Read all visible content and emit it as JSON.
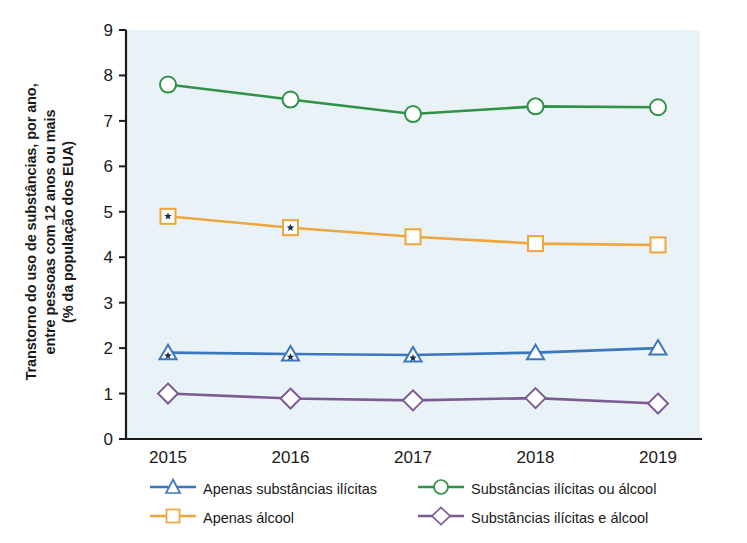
{
  "chart_data": {
    "type": "line",
    "title": "",
    "xlabel": "",
    "ylabel": "Transtorno do uso de substâncias, por ano, entre pessoas com 12 anos ou mais (% da população dos EUA)",
    "ylabel_lines": [
      "Transtorno do uso de substâncias, por ano,",
      "entre pessoas com 12 anos ou mais",
      "(% da população dos EUA)"
    ],
    "categories": [
      "2015",
      "2016",
      "2017",
      "2018",
      "2019"
    ],
    "x": [
      2015,
      2016,
      2017,
      2018,
      2019
    ],
    "ylim": [
      0,
      9
    ],
    "yticks": [
      "0",
      "1",
      "2",
      "3",
      "4",
      "5",
      "6",
      "7",
      "8",
      "9"
    ],
    "ytick_values": [
      0,
      1,
      2,
      3,
      4,
      5,
      6,
      7,
      8,
      9
    ],
    "grid": false,
    "legend_position": "bottom",
    "series": [
      {
        "name": "Apenas substâncias ilícitas",
        "key": "ilicitas",
        "color": "#3a77bd",
        "marker": "triangle",
        "values": [
          1.9,
          1.87,
          1.85,
          1.9,
          2.0
        ],
        "starred": [
          true,
          true,
          true,
          false,
          false
        ]
      },
      {
        "name": "Apenas álcool",
        "key": "alcool",
        "color": "#eda53c",
        "marker": "square",
        "values": [
          4.9,
          4.65,
          4.45,
          4.3,
          4.27
        ],
        "starred": [
          true,
          true,
          false,
          false,
          false
        ]
      },
      {
        "name": "Substâncias ilícitas ou álcool",
        "key": "ilicitas_ou_alcool",
        "color": "#2f9247",
        "marker": "circle",
        "values": [
          7.8,
          7.47,
          7.15,
          7.32,
          7.3
        ],
        "starred": [
          false,
          false,
          false,
          false,
          false
        ]
      },
      {
        "name": "Substâncias ilícitas e álcool",
        "key": "ilicitas_e_alcool",
        "color": "#7c5b93",
        "marker": "diamond",
        "values": [
          1.0,
          0.89,
          0.85,
          0.9,
          0.78
        ],
        "starred": [
          false,
          false,
          false,
          false,
          false
        ]
      }
    ],
    "plot_background": "#e9f2f7",
    "axis_color": "#1a1a1a"
  },
  "legend": {
    "rows": [
      [
        {
          "label": "Apenas substâncias ilícitas",
          "color": "#3a77bd",
          "marker": "triangle"
        },
        {
          "label": "Substâncias ilícitas ou álcool",
          "color": "#2f9247",
          "marker": "circle"
        }
      ],
      [
        {
          "label": "Apenas álcool",
          "color": "#eda53c",
          "marker": "square"
        },
        {
          "label": "Substâncias ilícitas e álcool",
          "color": "#7c5b93",
          "marker": "diamond"
        }
      ]
    ]
  }
}
